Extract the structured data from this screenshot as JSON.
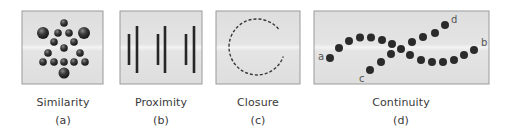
{
  "figure": {
    "panel_bg": "#e3e3e3",
    "panel_border": "#9a9a9a",
    "dot_color": "#2b2b2b",
    "text_color": "#3a3a3a",
    "panels": [
      {
        "id": "a",
        "title": "Similarity",
        "label": "(a)",
        "principle": "similarity",
        "content": "spheres of two sizes arranged in a triangular/tree pattern"
      },
      {
        "id": "b",
        "title": "Proximity",
        "label": "(b)",
        "principle": "proximity",
        "content": "three pairs of vertical lines (short + tall)"
      },
      {
        "id": "c",
        "title": "Closure",
        "label": "(c)",
        "principle": "closure",
        "content": "dashed open circle with a gap on the right"
      },
      {
        "id": "d",
        "title": "Continuity",
        "label": "(d)",
        "principle": "continuity",
        "content": "two intersecting curved dotted paths",
        "point_labels": [
          "a",
          "b",
          "c",
          "d"
        ]
      }
    ]
  }
}
